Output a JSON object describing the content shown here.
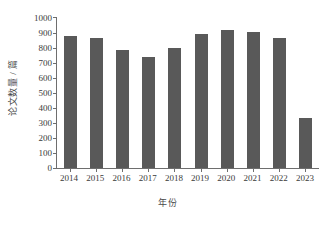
{
  "chart_data": {
    "type": "bar",
    "title": "",
    "subtitle": "",
    "xlabel": "年份",
    "ylabel": "论文数量 / 篇",
    "categories": [
      "2014",
      "2015",
      "2016",
      "2017",
      "2018",
      "2019",
      "2020",
      "2021",
      "2022",
      "2023"
    ],
    "values": [
      880,
      870,
      790,
      740,
      800,
      895,
      920,
      905,
      870,
      335
    ],
    "series": [
      {
        "name": "论文数量",
        "values": [
          880,
          870,
          790,
          740,
          800,
          895,
          920,
          905,
          870,
          335
        ]
      }
    ],
    "ylim": [
      0,
      1000
    ],
    "ytick_labels": [
      "0",
      "100",
      "200",
      "300",
      "400",
      "500",
      "600",
      "700",
      "800",
      "900",
      "1000"
    ],
    "ytick_values": [
      0,
      100,
      200,
      300,
      400,
      500,
      600,
      700,
      800,
      900,
      1000
    ],
    "xtick_labels": [
      "2014",
      "2015",
      "2016",
      "2017",
      "2018",
      "2019",
      "2020",
      "2021",
      "2022",
      "2023"
    ],
    "grid": false,
    "legend": false,
    "legend_position": "none",
    "bar_color": "#595959",
    "axis_color": "#6e6e6e",
    "background_color": "#ffffff",
    "annotations": []
  }
}
